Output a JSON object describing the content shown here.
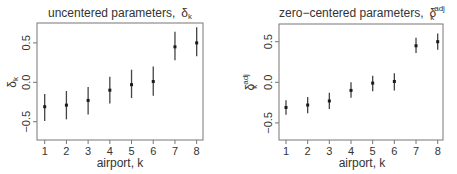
{
  "chart_data": [
    {
      "type": "scatter",
      "title": "uncentered parameters,",
      "title_symbol": "δ",
      "title_symbol_sub": "k",
      "title_symbol_sup": "",
      "xlabel": "airport, k",
      "ylabel_symbol": "δ",
      "ylabel_sub": "k",
      "ylabel_sup": "",
      "x": [
        1,
        2,
        3,
        4,
        5,
        6,
        7,
        8
      ],
      "xticks": [
        "1",
        "2",
        "3",
        "4",
        "5",
        "6",
        "7",
        "8"
      ],
      "yticks": [
        -0.5,
        0.0,
        0.5
      ],
      "ytick_labels": [
        "-0.5",
        "0.0",
        "0.5"
      ],
      "ylim": [
        -0.73,
        0.75
      ],
      "xlim": [
        0.67,
        8.29
      ],
      "grid": false,
      "legend": "none",
      "series": [
        {
          "name": "posterior mean ± interval",
          "values": [
            -0.31,
            -0.29,
            -0.23,
            -0.1,
            -0.03,
            0.01,
            0.45,
            0.5
          ],
          "lower": [
            -0.49,
            -0.47,
            -0.41,
            -0.27,
            -0.2,
            -0.17,
            0.28,
            0.33
          ],
          "upper": [
            -0.15,
            -0.11,
            -0.06,
            0.07,
            0.16,
            0.2,
            0.64,
            0.7
          ]
        }
      ]
    },
    {
      "type": "scatter",
      "title": "zero−centered parameters,",
      "title_symbol": "δ",
      "title_symbol_sub": "k",
      "title_symbol_sup": "adj",
      "xlabel": "airport, k",
      "ylabel_symbol": "δ",
      "ylabel_sub": "k",
      "ylabel_sup": "adj",
      "x": [
        1,
        2,
        3,
        4,
        5,
        6,
        7,
        8
      ],
      "xticks": [
        "1",
        "2",
        "3",
        "4",
        "5",
        "6",
        "7",
        "8"
      ],
      "yticks": [
        -0.5,
        0.0,
        0.5
      ],
      "ytick_labels": [
        "-0.5",
        "0.0",
        "0.5"
      ],
      "ylim": [
        -0.71,
        0.72
      ],
      "xlim": [
        0.67,
        8.26
      ],
      "grid": false,
      "legend": "none",
      "series": [
        {
          "name": "posterior mean ± interval",
          "values": [
            -0.31,
            -0.28,
            -0.23,
            -0.1,
            -0.01,
            0.01,
            0.45,
            0.5
          ],
          "lower": [
            -0.4,
            -0.38,
            -0.33,
            -0.19,
            -0.11,
            -0.1,
            0.36,
            0.4
          ],
          "upper": [
            -0.22,
            -0.18,
            -0.13,
            0.0,
            0.08,
            0.11,
            0.55,
            0.6
          ]
        }
      ]
    }
  ],
  "layout": [
    {
      "frame": {
        "x0": 37,
        "x1": 203,
        "y0": 23,
        "y1": 140
      },
      "xmap": {
        "x1_px": 44.7,
        "step_px": 21.71
      },
      "ymap": {
        "zero_px": 82.3,
        "px_per_unit": 78.8
      },
      "title_x": 120,
      "ylabel_x": 16,
      "xlabel_x": 120
    },
    {
      "frame": {
        "x0": 279,
        "x1": 443,
        "y0": 24,
        "y1": 140
      },
      "xmap": {
        "x1_px": 286.0,
        "step_px": 21.67
      },
      "ymap": {
        "zero_px": 82.3,
        "px_per_unit": 81.2
      },
      "title_x": 362,
      "ylabel_x": 254,
      "xlabel_x": 362
    }
  ]
}
